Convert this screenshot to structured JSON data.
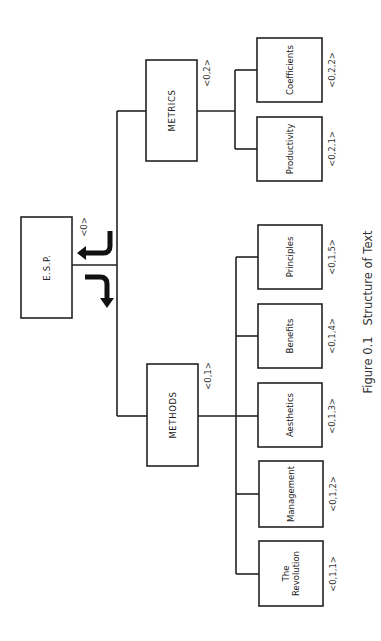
{
  "figure": {
    "caption": "Figure 0.1   Structure of Text",
    "caption_pos": {
      "x": 368,
      "y": 312
    },
    "colors": {
      "stroke": "#222222",
      "background": "#ffffff"
    }
  },
  "nodes": [
    {
      "id": "esp",
      "label": "E.S.P.",
      "code": "<0>",
      "x": 21,
      "y": 217,
      "w": 51,
      "h": 101,
      "code_x": 84,
      "code_y": 227
    },
    {
      "id": "metrics",
      "label": "METRICS",
      "code": "<0,2>",
      "x": 146,
      "y": 60,
      "w": 51,
      "h": 101,
      "code_x": 207,
      "code_y": 73
    },
    {
      "id": "methods",
      "label": "METHODS",
      "code": "<0,1>",
      "x": 147,
      "y": 364,
      "w": 51,
      "h": 102,
      "code_x": 208,
      "code_y": 376
    },
    {
      "id": "coefficients",
      "label": "Coefficients",
      "code": "<0,2,2>",
      "x": 257,
      "y": 38,
      "w": 65,
      "h": 64,
      "code_x": 332,
      "code_y": 70
    },
    {
      "id": "productivity",
      "label": "Productivity",
      "code": "<0,2,1>",
      "x": 257,
      "y": 117,
      "w": 65,
      "h": 64,
      "code_x": 332,
      "code_y": 149
    },
    {
      "id": "principles",
      "label": "Principles",
      "code": "<0,1,5>",
      "x": 258,
      "y": 225,
      "w": 64,
      "h": 64,
      "code_x": 332,
      "code_y": 257
    },
    {
      "id": "benefits",
      "label": "Benefits",
      "code": "<0,1,4>",
      "x": 258,
      "y": 304,
      "w": 64,
      "h": 64,
      "code_x": 332,
      "code_y": 336
    },
    {
      "id": "aesthetics",
      "label": "Aesthetics",
      "code": "<0,1,3>",
      "x": 258,
      "y": 383,
      "w": 64,
      "h": 64,
      "code_x": 332,
      "code_y": 416
    },
    {
      "id": "management",
      "label": "Management",
      "code": "<0,1,2>",
      "x": 259,
      "y": 461,
      "w": 64,
      "h": 66,
      "code_x": 333,
      "code_y": 494
    },
    {
      "id": "revolution",
      "label": "The Revolution",
      "label_lines": [
        "The",
        "Revolution"
      ],
      "code": "<0,1,1>",
      "x": 259,
      "y": 541,
      "w": 64,
      "h": 65,
      "code_x": 333,
      "code_y": 574
    }
  ],
  "edges": [
    {
      "from": "esp",
      "to": "root_bus",
      "points": [
        [
          72,
          265
        ],
        [
          117,
          265
        ]
      ]
    },
    {
      "from": "root_bus",
      "to": "bus",
      "points": [
        [
          117,
          111
        ],
        [
          117,
          416
        ]
      ]
    },
    {
      "from": "root_bus",
      "to": "metrics",
      "points": [
        [
          117,
          111
        ],
        [
          146,
          111
        ]
      ]
    },
    {
      "from": "root_bus",
      "to": "methods",
      "points": [
        [
          117,
          416
        ],
        [
          147,
          416
        ]
      ]
    },
    {
      "from": "metrics",
      "to": "metrics_bus",
      "points": [
        [
          197,
          111
        ],
        [
          235,
          111
        ]
      ]
    },
    {
      "from": "metrics_bus",
      "to": "bus",
      "points": [
        [
          235,
          70
        ],
        [
          235,
          149
        ]
      ]
    },
    {
      "from": "metrics_bus",
      "to": "coefficients",
      "points": [
        [
          235,
          70
        ],
        [
          257,
          70
        ]
      ]
    },
    {
      "from": "metrics_bus",
      "to": "productivity",
      "points": [
        [
          235,
          149
        ],
        [
          257,
          149
        ]
      ]
    },
    {
      "from": "methods",
      "to": "methods_bus",
      "points": [
        [
          198,
          416
        ],
        [
          236,
          416
        ]
      ]
    },
    {
      "from": "methods_bus",
      "to": "bus",
      "points": [
        [
          236,
          257
        ],
        [
          236,
          574
        ]
      ]
    },
    {
      "from": "methods_bus",
      "to": "principles",
      "points": [
        [
          236,
          257
        ],
        [
          258,
          257
        ]
      ]
    },
    {
      "from": "methods_bus",
      "to": "benefits",
      "points": [
        [
          236,
          336
        ],
        [
          258,
          336
        ]
      ]
    },
    {
      "from": "methods_bus",
      "to": "aesthetics",
      "points": [
        [
          236,
          416
        ],
        [
          258,
          416
        ]
      ]
    },
    {
      "from": "methods_bus",
      "to": "management",
      "points": [
        [
          236,
          494
        ],
        [
          259,
          494
        ]
      ]
    },
    {
      "from": "methods_bus",
      "to": "revolution",
      "points": [
        [
          236,
          574
        ],
        [
          259,
          574
        ]
      ]
    }
  ],
  "arrows": [
    {
      "name": "arrow-to-root",
      "path": "M110,231 L110,246 Q110,253 103,253 L84,253",
      "head": "77,253 86,246 86,260"
    },
    {
      "name": "arrow-from-root",
      "path": "M85,277 L100,277 Q107,277 107,284 L107,299",
      "head": "107,308 100,298 114,298"
    }
  ]
}
